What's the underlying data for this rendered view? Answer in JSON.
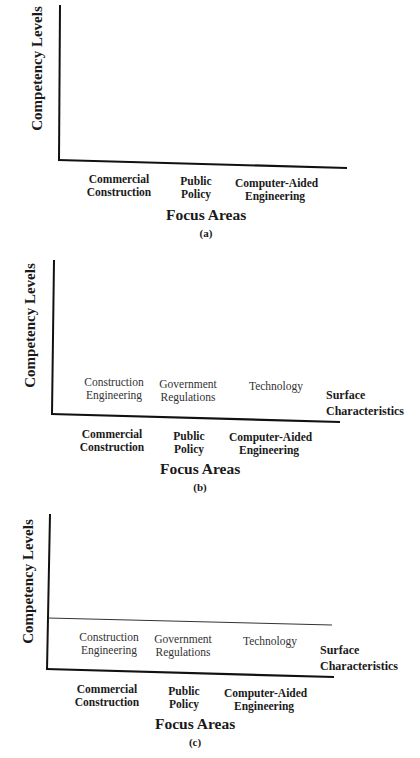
{
  "panels": [
    {
      "caption": "(a)",
      "y_axis_label": "Competency Levels",
      "x_axis_label": "Focus Areas",
      "focus_areas": [
        {
          "line1": "Commercial",
          "line2": "Construction"
        },
        {
          "line1": "Public",
          "line2": "Policy"
        },
        {
          "line1": "Computer-Aided",
          "line2": "Engineering"
        }
      ]
    },
    {
      "caption": "(b)",
      "y_axis_label": "Competency Levels",
      "x_axis_label": "Focus Areas",
      "surface_label": {
        "line1": "Surface",
        "line2": "Characteristics"
      },
      "surface_characteristics": [
        {
          "line1": "Construction",
          "line2": "Engineering"
        },
        {
          "line1": "Government",
          "line2": "Regulations"
        },
        {
          "line1": "Technology",
          "line2": ""
        }
      ],
      "focus_areas": [
        {
          "line1": "Commercial",
          "line2": "Construction"
        },
        {
          "line1": "Public",
          "line2": "Policy"
        },
        {
          "line1": "Computer-Aided",
          "line2": "Engineering"
        }
      ]
    },
    {
      "caption": "(c)",
      "y_axis_label": "Competency Levels",
      "x_axis_label": "Focus Areas",
      "surface_label": {
        "line1": "Surface",
        "line2": "Characteristics"
      },
      "surface_characteristics": [
        {
          "line1": "Construction",
          "line2": "Engineering"
        },
        {
          "line1": "Government",
          "line2": "Regulations"
        },
        {
          "line1": "Technology",
          "line2": ""
        }
      ],
      "focus_areas": [
        {
          "line1": "Commercial",
          "line2": "Construction"
        },
        {
          "line1": "Public",
          "line2": "Policy"
        },
        {
          "line1": "Computer-Aided",
          "line2": "Engineering"
        }
      ]
    }
  ]
}
